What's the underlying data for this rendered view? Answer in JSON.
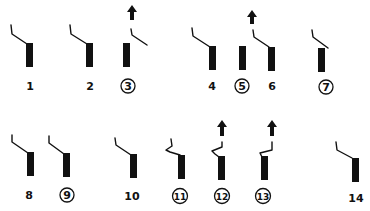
{
  "diagram": {
    "colors": {
      "ink": "#111111",
      "background": "#ffffff"
    },
    "figures": [
      {
        "id": "1",
        "label": "1",
        "circled": false,
        "arrow": false,
        "contact": "closed"
      },
      {
        "id": "2",
        "label": "2",
        "circled": false,
        "arrow": false,
        "contact": "closed"
      },
      {
        "id": "3",
        "label": "3",
        "circled": true,
        "arrow": true,
        "contact": "open"
      },
      {
        "id": "4",
        "label": "4",
        "circled": false,
        "arrow": false,
        "contact": "closed"
      },
      {
        "id": "5",
        "label": "5",
        "circled": true,
        "arrow": false,
        "contact": "bar-only"
      },
      {
        "id": "6",
        "label": "6",
        "circled": false,
        "arrow": true,
        "contact": "closed"
      },
      {
        "id": "7",
        "label": "7",
        "circled": true,
        "arrow": false,
        "contact": "closed"
      },
      {
        "id": "8",
        "label": "8",
        "circled": false,
        "arrow": false,
        "contact": "closed"
      },
      {
        "id": "9",
        "label": "9",
        "circled": true,
        "arrow": false,
        "contact": "closed"
      },
      {
        "id": "10",
        "label": "10",
        "circled": false,
        "arrow": false,
        "contact": "closed"
      },
      {
        "id": "11",
        "label": "11",
        "circled": true,
        "arrow": false,
        "contact": "zigzag"
      },
      {
        "id": "12",
        "label": "12",
        "circled": true,
        "arrow": true,
        "contact": "zigzag"
      },
      {
        "id": "13",
        "label": "13",
        "circled": true,
        "arrow": true,
        "contact": "zigzag"
      },
      {
        "id": "14",
        "label": "14",
        "circled": false,
        "arrow": false,
        "contact": "closed"
      }
    ]
  }
}
